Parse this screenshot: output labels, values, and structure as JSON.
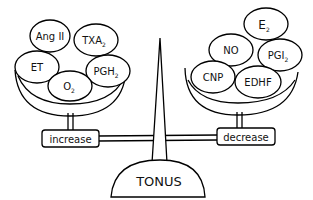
{
  "diagram": {
    "title": "TONUS",
    "left_pan": {
      "label": "increase",
      "factors": [
        {
          "name": "Ang II",
          "base": "Ang II",
          "sub": ""
        },
        {
          "name": "TXA2",
          "base": "TXA",
          "sub": "2"
        },
        {
          "name": "ET",
          "base": "ET",
          "sub": ""
        },
        {
          "name": "O2",
          "base": "O",
          "sub": "2"
        },
        {
          "name": "PGH2",
          "base": "PGH",
          "sub": "2"
        }
      ]
    },
    "right_pan": {
      "label": "decrease",
      "factors": [
        {
          "name": "E2",
          "base": "E",
          "sub": "2"
        },
        {
          "name": "NO",
          "base": "NO",
          "sub": ""
        },
        {
          "name": "PGI2",
          "base": "PGI",
          "sub": "2"
        },
        {
          "name": "CNP",
          "base": "CNP",
          "sub": ""
        },
        {
          "name": "EDHF",
          "base": "EDHF",
          "sub": ""
        }
      ]
    },
    "colors": {
      "line": "#000000",
      "background": "#ffffff"
    }
  }
}
